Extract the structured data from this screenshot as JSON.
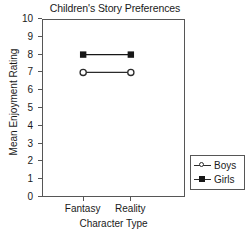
{
  "chart_data": {
    "type": "line",
    "title": "Children's Story Preferences",
    "xlabel": "Character Type",
    "ylabel": "Mean Enjoyment Rating",
    "categories": [
      "Fantasy",
      "Reality"
    ],
    "series": [
      {
        "name": "Boys",
        "values": [
          7,
          7
        ],
        "marker": "open-circle",
        "color": "#2b2b2b"
      },
      {
        "name": "Girls",
        "values": [
          8,
          8
        ],
        "marker": "filled-square",
        "color": "#171717"
      }
    ],
    "ylim": [
      0,
      10
    ],
    "yticks": [
      10,
      9,
      8,
      7,
      6,
      5,
      4,
      3,
      2,
      1,
      0
    ],
    "ytick_labels": [
      "10",
      "9",
      "8",
      "7",
      "6",
      "5",
      "4",
      "3",
      "2",
      "1",
      "0"
    ],
    "grid": false,
    "legend_position": "right-lower",
    "frame": "box",
    "background": "#ffffff",
    "axis_color": "#565656"
  },
  "legend": {
    "entries": [
      {
        "label": "Boys",
        "marker": "open-circle"
      },
      {
        "label": "Girls",
        "marker": "filled-square"
      }
    ]
  }
}
